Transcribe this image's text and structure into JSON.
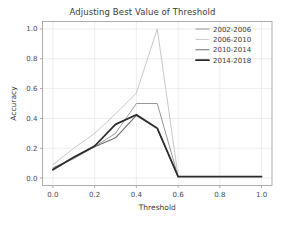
{
  "chart_data": {
    "type": "line",
    "title": "Adjusting Best Value of Threshold",
    "xlabel": "Threshold",
    "ylabel": "Accuracy",
    "xlim": [
      -0.05,
      1.05
    ],
    "ylim": [
      -0.05,
      1.05
    ],
    "grid": true,
    "legend_position": "upper right",
    "xticks": [
      "0.0",
      "0.2",
      "0.4",
      "0.6",
      "0.8",
      "1.0"
    ],
    "xtick_values": [
      0.0,
      0.2,
      0.4,
      0.6,
      0.8,
      1.0
    ],
    "yticks": [
      "0.0",
      "0.2",
      "0.4",
      "0.6",
      "0.8",
      "1.0"
    ],
    "ytick_values": [
      0.0,
      0.2,
      0.4,
      0.6,
      0.8,
      1.0
    ],
    "x": [
      0.0,
      0.1,
      0.2,
      0.3,
      0.4,
      0.5,
      0.6,
      0.7,
      0.8,
      0.9,
      1.0
    ],
    "series": [
      {
        "name": "2002-2006",
        "color": "#8c8c8c",
        "width": 0.9,
        "values": [
          0.07,
          0.13,
          0.21,
          0.3,
          0.5,
          0.5,
          0.01,
          0.01,
          0.01,
          0.01,
          0.01
        ]
      },
      {
        "name": "2006-2010",
        "color": "#c2c2c2",
        "width": 0.9,
        "values": [
          0.09,
          0.2,
          0.3,
          0.43,
          0.57,
          1.0,
          0.01,
          0.01,
          0.01,
          0.01,
          0.01
        ]
      },
      {
        "name": "2010-2014",
        "color": "#6e6e6e",
        "width": 1.1,
        "values": [
          0.06,
          0.14,
          0.21,
          0.27,
          0.42,
          0.33,
          0.01,
          0.01,
          0.01,
          0.01,
          0.01
        ]
      },
      {
        "name": "2014-2018",
        "color": "#2b2b2b",
        "width": 1.7,
        "values": [
          0.055,
          0.14,
          0.215,
          0.36,
          0.425,
          0.335,
          0.01,
          0.01,
          0.01,
          0.01,
          0.01
        ]
      }
    ]
  },
  "legend": {
    "items": [
      {
        "label": "2002-2006"
      },
      {
        "label": "2006-2010"
      },
      {
        "label": "2010-2014"
      },
      {
        "label": "2014-2018"
      }
    ]
  }
}
